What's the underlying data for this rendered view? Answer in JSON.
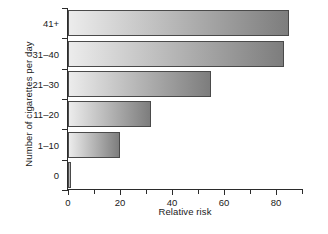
{
  "chart_data": {
    "type": "bar",
    "orientation": "horizontal",
    "title": "",
    "xlabel": "Relative risk",
    "ylabel": "Number of cigarettes per day",
    "categories": [
      "0",
      "1–10",
      "11–20",
      "21–30",
      "31–40",
      "41+"
    ],
    "values": [
      1,
      20,
      32,
      55,
      83,
      85
    ],
    "xlim": [
      0,
      90
    ],
    "ylim": [
      0,
      6
    ],
    "xticks_major": [
      0,
      20,
      40,
      60,
      80
    ],
    "xticks_minor": [
      10,
      30,
      50,
      70,
      90
    ],
    "xtick_labels": [
      "0",
      "20",
      "40",
      "60",
      "80"
    ],
    "grid": false,
    "legend": false,
    "bar_fill_start": "#ececec",
    "bar_fill_end": "#7d7d7d",
    "bar_edge_color": "#4a4a4a",
    "axis_color": "#2b2b2b",
    "background": "#ffffff"
  }
}
